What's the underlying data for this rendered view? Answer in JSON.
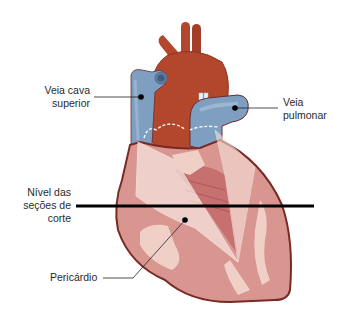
{
  "diagram": {
    "colors": {
      "aorta": "#b2472c",
      "aorta_shadow": "#8e3420",
      "vein_blue": "#7f9fc0",
      "vein_blue_light": "#a9c1da",
      "vein_blue_dark": "#5e7fa3",
      "heart_outline": "#7a2a24",
      "myocardium": "#d99690",
      "myocardium_light": "#f0cfc6",
      "myocardium_pale": "#f7e3dc",
      "ventricle_dark": "#c26b6b",
      "cut_line": "#000000",
      "leader_line": "#222222",
      "dashed_line": "#ffffff"
    }
  },
  "labels": {
    "veia_cava_superior": {
      "lines": [
        "Veia cava",
        "superior"
      ]
    },
    "veia_pulmonar": {
      "lines": [
        "Veia",
        "pulmonar"
      ]
    },
    "nivel_secoes_corte": {
      "lines": [
        "Nível das",
        "seções de",
        "corte"
      ]
    },
    "pericardio": {
      "lines": [
        "Pericárdio"
      ]
    }
  },
  "markers": {
    "veia_cava_superior": {
      "x": 141,
      "y": 97
    },
    "veia_pulmonar": {
      "x": 235,
      "y": 108
    },
    "pericardio": {
      "x": 185,
      "y": 220
    }
  },
  "cut_line": {
    "y": 206,
    "x1": 76,
    "x2": 314
  }
}
